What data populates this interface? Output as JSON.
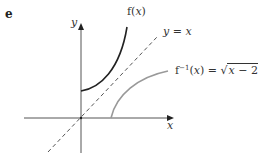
{
  "figure": {
    "part_label": "e",
    "axes": {
      "x_label": "x",
      "y_label": "y"
    },
    "curves": {
      "f": {
        "label_name": "f(",
        "label_var": "x",
        "label_close": ")",
        "color": "#222222",
        "style": "solid"
      },
      "identity": {
        "label_y": "y",
        "label_eq": " = ",
        "label_x": "x",
        "color": "#555555",
        "style": "dashed"
      },
      "inverse": {
        "label_f": "f",
        "label_exp": "−1",
        "label_open": "(",
        "label_var": "x",
        "label_close": ") = ",
        "label_sqrt_glyph": "√",
        "label_radicand_var": "x",
        "label_radicand_rest": " − 2",
        "color": "#999999",
        "style": "solid"
      }
    }
  }
}
